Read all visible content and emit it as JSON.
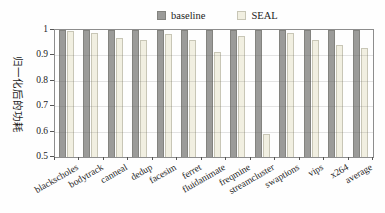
{
  "chart_data": {
    "type": "bar",
    "title": "",
    "ylabel": "归一化后的功耗",
    "xlabel": "",
    "categories": [
      "blackscholes",
      "bodytrack",
      "canneal",
      "dedup",
      "facesim",
      "ferret",
      "fluidanimate",
      "freqmine",
      "streamcluster",
      "swaptions",
      "vips",
      "x264",
      "average"
    ],
    "series": [
      {
        "name": "baseline",
        "color": "#9b9b99",
        "border": "#83837f",
        "values": [
          1.0,
          1.0,
          1.0,
          1.0,
          1.0,
          1.0,
          1.0,
          1.0,
          1.0,
          1.0,
          1.0,
          1.0,
          1.0
        ]
      },
      {
        "name": "SEAL",
        "color": "#f1efe1",
        "border": "#c8c6b6",
        "values": [
          0.995,
          0.99,
          0.97,
          0.96,
          0.985,
          0.96,
          0.915,
          0.975,
          0.59,
          0.99,
          0.96,
          0.94,
          0.93
        ]
      }
    ],
    "ylim": [
      0.5,
      1.0
    ],
    "yticks": [
      "1",
      "0.9",
      "0.8",
      "0.7",
      "0.6",
      "0.5"
    ],
    "grid": "horizontal",
    "legend_position": "top-center",
    "axis_color": "#8d8d8d",
    "text_color": "#1c1c1c"
  }
}
